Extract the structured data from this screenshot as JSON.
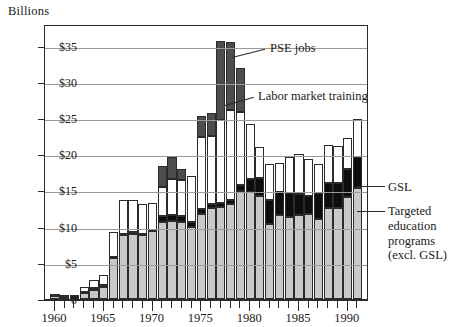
{
  "figure": {
    "axis_title": "Billions",
    "y_ticks": [
      "$35",
      "$30",
      "$25",
      "$20",
      "$15",
      "$10",
      "$5",
      "0"
    ],
    "x_labels": [
      "1960",
      "1965",
      "1970",
      "1975",
      "1980",
      "1985",
      "1990"
    ],
    "callouts": {
      "pse": "PSE jobs",
      "lmt": "Labor market training",
      "gsl": "GSL",
      "targeted": "Targeted\neducation\nprograms\n(excl. GSL)"
    },
    "colors": {
      "targeted": "#c9c9c9",
      "gsl": "#0d0d0d",
      "labor_market_training": "#ffffff",
      "pse_jobs": "#4d4d4d",
      "axis": "#2a2a2a",
      "grid": "#9a9a9a"
    }
  },
  "chart_data": {
    "type": "bar",
    "stacked": true,
    "title": "",
    "subtitle": "",
    "xlabel": "",
    "ylabel": "Billions",
    "ylim": [
      0,
      38
    ],
    "ytick_values": [
      0,
      5,
      10,
      15,
      20,
      25,
      30,
      35
    ],
    "grid": true,
    "legend": "annotations",
    "categories": [
      1960,
      1961,
      1962,
      1963,
      1964,
      1965,
      1966,
      1967,
      1968,
      1969,
      1970,
      1971,
      1972,
      1973,
      1974,
      1975,
      1976,
      1977,
      1978,
      1979,
      1980,
      1981,
      1982,
      1983,
      1984,
      1985,
      1986,
      1987,
      1988,
      1989,
      1990,
      1991
    ],
    "series": [
      {
        "name": "Targeted education programs (excl. GSL)",
        "color": "#c9c9c9",
        "values": [
          0.4,
          0.3,
          0.3,
          0.8,
          1.3,
          1.7,
          5.6,
          8.8,
          9.0,
          8.8,
          9.4,
          10.7,
          10.8,
          10.6,
          9.9,
          11.8,
          12.6,
          12.7,
          13.1,
          14.9,
          14.8,
          14.2,
          10.3,
          11.6,
          11.4,
          11.6,
          11.7,
          11.1,
          12.6,
          12.6,
          14.1,
          15.4
        ]
      },
      {
        "name": "GSL",
        "color": "#0d0d0d",
        "values": [
          0.3,
          0.2,
          0.2,
          0.2,
          0.2,
          0.2,
          0.2,
          0.2,
          0.2,
          0.2,
          0.2,
          0.8,
          0.8,
          0.9,
          0.7,
          0.6,
          0.5,
          0.5,
          0.6,
          0.8,
          1.8,
          2.5,
          3.4,
          3.2,
          3.2,
          2.9,
          2.6,
          3.5,
          3.4,
          3.5,
          3.8,
          4.2
        ]
      },
      {
        "name": "Labor market training",
        "color": "#ffffff",
        "values": [
          0.0,
          0.0,
          0.0,
          0.7,
          1.1,
          1.4,
          3.5,
          4.7,
          4.5,
          4.1,
          3.6,
          4.0,
          5.0,
          4.9,
          6.4,
          10.0,
          9.4,
          11.5,
          12.4,
          10.2,
          7.6,
          4.3,
          4.9,
          4.0,
          5.0,
          5.5,
          5.1,
          4.1,
          5.3,
          5.0,
          4.4,
          5.3
        ]
      },
      {
        "name": "PSE jobs",
        "color": "#4d4d4d",
        "values": [
          0,
          0,
          0,
          0,
          0,
          0,
          0,
          0,
          0,
          0,
          0,
          2.9,
          3.0,
          1.6,
          0,
          2.9,
          3.2,
          11.0,
          9.4,
          6.0,
          0,
          0,
          0,
          0,
          0,
          0,
          0,
          0,
          0,
          0,
          0,
          0
        ]
      }
    ],
    "annotations": [
      {
        "text": "PSE jobs",
        "target_year": 1978
      },
      {
        "text": "Labor market training",
        "target_year": 1979
      },
      {
        "text": "GSL",
        "target_year": 1991
      },
      {
        "text": "Targeted education programs (excl. GSL)",
        "target_year": 1991
      }
    ]
  }
}
